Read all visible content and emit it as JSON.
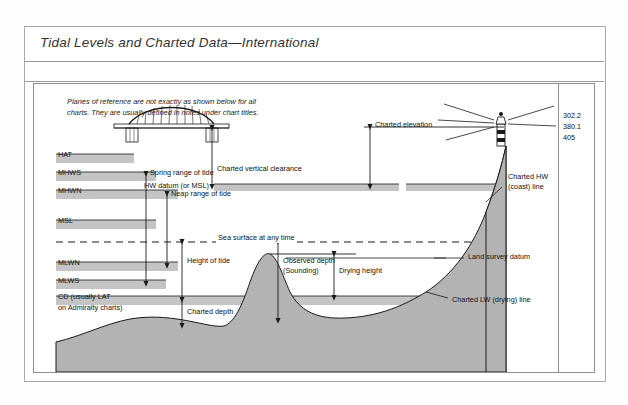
{
  "header": {
    "title": "Tidal Levels and Charted Data—International",
    "page_number": "20"
  },
  "intro": {
    "text": "Planes of reference are not exactly as shown below for all charts. They are usually defined in notes under chart titles."
  },
  "datum_bars": [
    {
      "label": "HAT",
      "y": 70,
      "width": 78
    },
    {
      "label": "MHWS",
      "y": 88,
      "width": 100
    },
    {
      "label": "MHWN",
      "y": 106,
      "width": 122
    },
    {
      "label": "MSL",
      "y": 136,
      "width": 100
    },
    {
      "label": "MLWN",
      "y": 178,
      "width": 122
    },
    {
      "label": "MLWS",
      "y": 196,
      "width": 110
    },
    {
      "label": "CD (usually LAT",
      "label2": "on Admiralty charts)",
      "y": 212,
      "width": 400
    }
  ],
  "annotations": {
    "spring_range": "Spring range of tide",
    "neap_range": "Neap range of tide",
    "sea_surface": "Sea surface at any time",
    "height_of_tide": "Height of tide",
    "observed_depth_l1": "Observed depth",
    "observed_depth_l2": "(Sounding)",
    "charted_depth": "Charted depth",
    "drying_height": "Drying height",
    "charted_vertical_clearance": "Charted vertical clearance",
    "hw_datum": "HW datum (or MSL)",
    "charted_elevation": "Charted elevation",
    "charted_hw_l1": "Charted HW",
    "charted_hw_l2": "(coast) line",
    "land_survey_datum": "Land survey datum",
    "charted_lw_line": "Charted LW (drying) line"
  },
  "elevation_values": [
    "302.2",
    "380.1",
    "405"
  ],
  "colors": {
    "land_fill": "#b3b3b3",
    "bar_fill": "#c4c4c4",
    "line": "#1a1a1a",
    "frame": "#8f8f8f",
    "title_text": "#333333"
  }
}
